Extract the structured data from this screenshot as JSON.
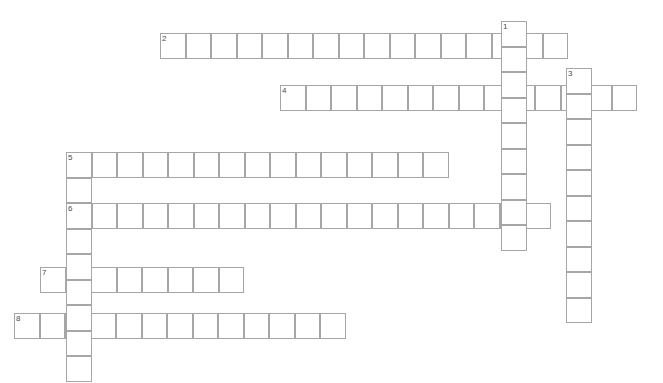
{
  "puzzle": {
    "kind": "crossword-grid",
    "title": "",
    "width_px": 663,
    "height_px": 383,
    "cell_size_px": 25.5,
    "background_color": "#ffffff",
    "cell_fill_color": "#ffffff",
    "cell_border_color": "#a6a6a6",
    "number_color": "#4a4a4a",
    "total_entries": 9,
    "across_count": 6,
    "down_count": 3
  },
  "entries": {
    "across": [
      {
        "number": "2",
        "length": 16,
        "x": 160,
        "y": 33,
        "label": "entry-2-across"
      },
      {
        "number": "4",
        "length": 14,
        "x": 280,
        "y": 85,
        "label": "entry-4-across"
      },
      {
        "number": "5",
        "length": 15,
        "x": 66,
        "y": 152,
        "label": "entry-5-across"
      },
      {
        "number": "6",
        "length": 19,
        "x": 66,
        "y": 203,
        "label": "entry-6-across"
      },
      {
        "number": "7",
        "length": 8,
        "x": 40,
        "y": 267,
        "label": "entry-7-across"
      },
      {
        "number": "8",
        "length": 13,
        "x": 14,
        "y": 313,
        "label": "entry-8-across"
      }
    ],
    "down": [
      {
        "number": "1",
        "length": 9,
        "x": 501,
        "y": 21,
        "label": "entry-1-down"
      },
      {
        "number": "3",
        "length": 10,
        "x": 566,
        "y": 68,
        "label": "entry-3-down"
      },
      {
        "number": "5",
        "length": 9,
        "x": 66,
        "y": 152,
        "label": "entry-5-down"
      }
    ]
  },
  "numbers_shown": [
    "1",
    "2",
    "3",
    "4",
    "5",
    "6",
    "7",
    "8"
  ]
}
